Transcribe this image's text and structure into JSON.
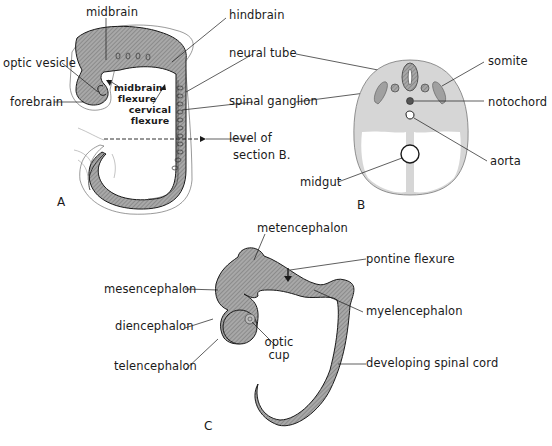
{
  "figure": {
    "panels": [
      {
        "id": "A",
        "label": "A"
      },
      {
        "id": "B",
        "label": "B"
      },
      {
        "id": "C",
        "label": "C"
      }
    ]
  },
  "panel_a": {
    "labels": {
      "midbrain": "midbrain",
      "hindbrain": "hindbrain",
      "optic_vesicle": "optic vesicle",
      "forebrain": "forebrain",
      "neural_tube": "neural tube",
      "spinal_ganglion": "spinal ganglion",
      "midbrain_flexure_1": "midbrain",
      "midbrain_flexure_2": "flexure",
      "cervical_flexure_1": "cervical",
      "cervical_flexure_2": "flexure",
      "level_of_section_1": "level of",
      "level_of_section_2": "section B."
    }
  },
  "panel_b": {
    "labels": {
      "somite": "somite",
      "notochord": "notochord",
      "aorta": "aorta",
      "midgut": "midgut"
    }
  },
  "panel_c": {
    "labels": {
      "metencephalon": "metencephalon",
      "pontine_flexure": "pontine flexure",
      "mesencephalon": "mesencephalon",
      "myelencephalon": "myelencephalon",
      "diencephalon": "diencephalon",
      "optic_cup_1": "optic",
      "optic_cup_2": "cup",
      "telencephalon": "telencephalon",
      "developing_spinal_cord": "developing spinal cord"
    }
  },
  "colors": {
    "tissue_fill": "#9a9a9a",
    "section_fill": "#d6d6d6",
    "line": "#1a1a1a"
  }
}
